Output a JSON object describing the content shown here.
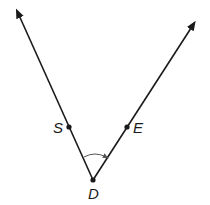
{
  "diagram": {
    "type": "angle",
    "vertex": {
      "label": "D"
    },
    "rays": [
      {
        "name": "ray-DS",
        "through_point": "S"
      },
      {
        "name": "ray-DE",
        "through_point": "E"
      }
    ],
    "points": [
      {
        "label": "S"
      },
      {
        "label": "E"
      },
      {
        "label": "D"
      }
    ],
    "angle_arc": {
      "direction": "from DS toward DE"
    },
    "colors": {
      "line": "#1a1a1a",
      "arc": "#555555",
      "background": "#ffffff"
    }
  }
}
